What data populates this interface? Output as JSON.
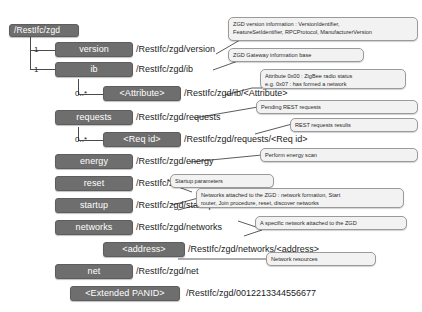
{
  "diagram": {
    "colors": {
      "node_fill": "#6e6e6e",
      "node_text": "#ffffff",
      "callout_fill": "#f2f2f2",
      "callout_border": "#9a9a9a",
      "line": "#4a4a4a",
      "background": "#ffffff"
    }
  },
  "nodes": [
    {
      "id": "root",
      "label": "/RestIfc/zgd"
    },
    {
      "id": "version",
      "label": "version"
    },
    {
      "id": "ib",
      "label": "ib"
    },
    {
      "id": "attribute",
      "label": "<Attribute>"
    },
    {
      "id": "requests",
      "label": "requests"
    },
    {
      "id": "reqid",
      "label": "<Req id>"
    },
    {
      "id": "energy",
      "label": "energy"
    },
    {
      "id": "reset",
      "label": "reset"
    },
    {
      "id": "startup",
      "label": "startup"
    },
    {
      "id": "networks",
      "label": "networks"
    },
    {
      "id": "address",
      "label": "<address>"
    },
    {
      "id": "net",
      "label": "net"
    },
    {
      "id": "panid",
      "label": "<Extended PANID>"
    }
  ],
  "uris": [
    {
      "id": "uri-version",
      "text": "/RestIfc/zgd/version"
    },
    {
      "id": "uri-ib",
      "text": "/RestIfc/zgd/ib"
    },
    {
      "id": "uri-attribute",
      "text": "/RestIfc/zgd/ib/<Attribute>"
    },
    {
      "id": "uri-requests",
      "text": "/RestIfc/zgd/requests"
    },
    {
      "id": "uri-reqid",
      "text": "/RestIfc/zgd/requests/<Req id>"
    },
    {
      "id": "uri-energy",
      "text": "/RestIfc/zgd/energy"
    },
    {
      "id": "uri-reset",
      "text": "/RestIfc/zgd/reset"
    },
    {
      "id": "uri-startup",
      "text": "/RestIfc/zgd/startup"
    },
    {
      "id": "uri-networks",
      "text": "/RestIfc/zgd/networks"
    },
    {
      "id": "uri-address",
      "text": "/RestIfc/zgd/networks/<address>"
    },
    {
      "id": "uri-net",
      "text": "/RestIfc/zgd/net"
    },
    {
      "id": "uri-panid",
      "text": "/RestIfc/zgd/0012213344556677"
    }
  ],
  "multiplicities": [
    {
      "id": "mult-version",
      "text": "1"
    },
    {
      "id": "mult-ib",
      "text": "1"
    },
    {
      "id": "mult-attribute",
      "text": "0..*"
    },
    {
      "id": "mult-reqid",
      "text": "0..*"
    }
  ],
  "callouts": [
    {
      "id": "callout-version",
      "lines": [
        "ZGD version information : VersionIdentifier,",
        "FeatureSetIdentifier, RPCProtocol, ManufacturerVersion"
      ]
    },
    {
      "id": "callout-ib",
      "lines": [
        "ZGD Gateway information base"
      ]
    },
    {
      "id": "callout-attribute",
      "lines": [
        "Attribute 0x00 : ZigBee radio status",
        "e.g. 0x07 : has formed a network"
      ]
    },
    {
      "id": "callout-requests",
      "lines": [
        "Pending REST requests"
      ]
    },
    {
      "id": "callout-reqid",
      "lines": [
        "REST requests results"
      ]
    },
    {
      "id": "callout-energy",
      "lines": [
        "Perform energy scan"
      ]
    },
    {
      "id": "callout-reset",
      "lines": [
        "Startup parameters"
      ]
    },
    {
      "id": "callout-startup",
      "lines": [
        "Networks attached to the ZGD : network formation, Start",
        "router, Join procedure, reset, discover networks"
      ]
    },
    {
      "id": "callout-networks",
      "lines": [
        "A specific network attached to the ZGD"
      ]
    },
    {
      "id": "callout-net",
      "lines": [
        "Network resources"
      ]
    }
  ]
}
